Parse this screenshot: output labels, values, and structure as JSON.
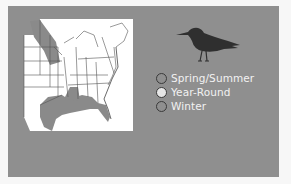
{
  "map": {
    "region": "Eastern United States",
    "shaded_areas": [
      "Year-round gulf coast range",
      "Northern plains summer range"
    ]
  },
  "bird": {
    "icon": "bird-silhouette-icon"
  },
  "legend": {
    "items": [
      {
        "label": "Spring/Summer",
        "color": "#8f8f8f"
      },
      {
        "label": "Year-Round",
        "color": "#e6e6e6"
      },
      {
        "label": "Winter",
        "color": "#8f8f8f"
      }
    ]
  },
  "colors": {
    "panel": "#8f8f8f",
    "map_fill": "#ffffff",
    "range_shade": "#8a8a8a"
  }
}
